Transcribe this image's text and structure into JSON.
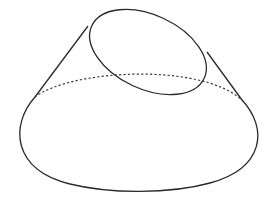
{
  "figure": {
    "type": "truncated-cone-oblique-section",
    "width": 270,
    "height": 201,
    "background": "#ffffff",
    "stroke_color": "#2a2a2a"
  },
  "shapes": {
    "base_ellipse": {
      "cx": 137.5,
      "cy": 127,
      "rx": 120.5,
      "ry": 64
    },
    "hidden_back_arc": {
      "style": "dotted",
      "from": [
        35,
        97
      ],
      "to": [
        242,
        100
      ],
      "peak_y": 66
    },
    "left_generatrix": {
      "from": [
        88,
        26
      ],
      "to": [
        35,
        97
      ]
    },
    "right_generatrix": {
      "from": [
        207,
        52
      ],
      "to": [
        242,
        100
      ]
    },
    "top_section_ellipse": {
      "cx": 148,
      "cy": 52,
      "rx": 62,
      "ry": 38,
      "rotation_deg": 25
    }
  }
}
